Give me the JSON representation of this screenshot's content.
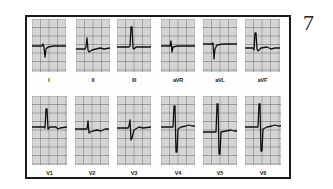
{
  "figure": {
    "number": "7",
    "colors": {
      "frame": "#1a1a1a",
      "grid_minor": "#b8b8b8",
      "grid_major": "#6e6e6e",
      "paper": "#e4e4e4",
      "trace": "#111111"
    }
  },
  "leads": [
    {
      "id": "I",
      "label": "I",
      "x": 32,
      "y": 19,
      "w": 34,
      "h": 53,
      "baseline": 27,
      "path": "M0,27 L10,27 L11,25 L12,28 L13,38 L14,30 L16,28 L22,27 L34,27"
    },
    {
      "id": "II",
      "label": "II",
      "x": 76,
      "y": 19,
      "w": 34,
      "h": 53,
      "baseline": 30,
      "path": "M0,30 L9,30 L10,28 L11,19 L12,31 L13,33 L16,31 L20,30 L24,29 L28,30 L34,29"
    },
    {
      "id": "III",
      "label": "III",
      "x": 117,
      "y": 19,
      "w": 34,
      "h": 53,
      "baseline": 28,
      "path": "M0,28 L12,28 L13,27 L14,8 L15,8 L16,29 L17,30 L19,28 L34,28"
    },
    {
      "id": "aVR",
      "label": "aVR",
      "x": 161,
      "y": 19,
      "w": 34,
      "h": 53,
      "baseline": 27,
      "path": "M0,27 L9,27 L10,22 L11,33 L12,28 L16,27 L34,27"
    },
    {
      "id": "aVL",
      "label": "aVL",
      "x": 203,
      "y": 19,
      "w": 34,
      "h": 53,
      "baseline": 25,
      "path": "M0,25 L9,25 L10,24 L11,40 L12,30 L14,26 L20,25 L34,25"
    },
    {
      "id": "aVF",
      "label": "aVF",
      "x": 245,
      "y": 19,
      "w": 35,
      "h": 53,
      "baseline": 29,
      "path": "M0,29 L8,29 L9,31 L10,14 L11,14 L12,30 L13,32 L16,29 L22,28 L26,30 L30,29 L35,29"
    },
    {
      "id": "V1",
      "label": "V1",
      "x": 32,
      "y": 96,
      "w": 35,
      "h": 69,
      "baseline": 31,
      "path": "M0,31 L12,31 L13,32 L14,13 L15,13 L16,33 L18,31 L24,31 L26,33 L28,32 L35,31"
    },
    {
      "id": "V2",
      "label": "V2",
      "x": 75,
      "y": 96,
      "w": 34,
      "h": 69,
      "baseline": 33,
      "path": "M0,33 L12,33 L13,25 L14,37 L15,36 L18,35 L22,34 L26,35 L30,33 L34,33"
    },
    {
      "id": "V3",
      "label": "V3",
      "x": 117,
      "y": 96,
      "w": 34,
      "h": 69,
      "baseline": 32,
      "path": "M0,32 L11,32 L12,30 L13,24 L14,44 L15,42 L17,34 L22,31 L26,32 L34,31"
    },
    {
      "id": "V4",
      "label": "V4",
      "x": 161,
      "y": 96,
      "w": 34,
      "h": 69,
      "baseline": 31,
      "path": "M0,31 L12,31 L13,10 L14,10 L15,56 L16,56 L17,33 L20,31 L25,30 L28,29 L31,30 L34,30"
    },
    {
      "id": "V5",
      "label": "V5",
      "x": 203,
      "y": 96,
      "w": 34,
      "h": 69,
      "baseline": 36,
      "path": "M0,36 L13,36 L14,8 L15,8 L16,58 L17,58 L18,36 L23,35 L28,34 L31,35 L34,35"
    },
    {
      "id": "V6",
      "label": "V6",
      "x": 245,
      "y": 96,
      "w": 36,
      "h": 69,
      "baseline": 31,
      "path": "M0,31 L13,31 L14,8 L15,8 L16,55 L17,55 L18,33 L22,31 L27,30 L30,29 L33,30 L36,30"
    }
  ]
}
